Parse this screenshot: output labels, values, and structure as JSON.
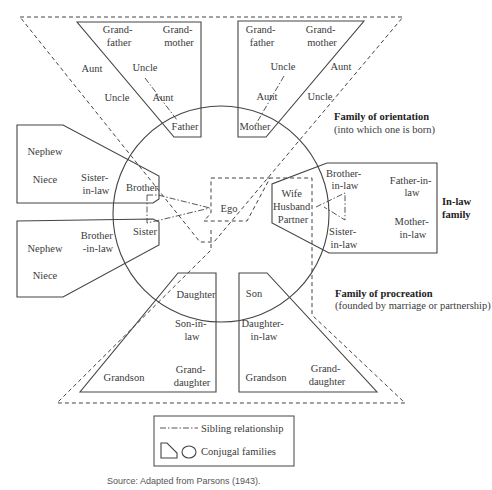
{
  "diagram": {
    "center": {
      "ego": "Ego"
    },
    "orientation_family": {
      "heading": "Family of orientation",
      "subheading": "(into which one is born)",
      "father_box": {
        "grandfather": [
          "Grand-",
          "father"
        ],
        "grandmother": [
          "Grand-",
          "mother"
        ],
        "aunt_outer": "Aunt",
        "uncle_outer": "Uncle",
        "uncle_inner": "Uncle",
        "aunt_inner": "Aunt",
        "parent": "Father"
      },
      "mother_box": {
        "grandfather": [
          "Grand-",
          "father"
        ],
        "grandmother": [
          "Grand-",
          "mother"
        ],
        "uncle_inner": "Uncle",
        "aunt_inner": "Aunt",
        "aunt_outer": "Aunt",
        "uncle_outer": "Uncle",
        "parent": "Mother"
      }
    },
    "sibling_boxes": {
      "brother_box": {
        "nephew": "Nephew",
        "niece": "Niece",
        "spouse": [
          "Sister-",
          "in-law"
        ],
        "sibling": "Brother"
      },
      "sister_box": {
        "nephew": "Nephew",
        "niece": "Niece",
        "spouse": [
          "Brother",
          "-in-law"
        ],
        "sibling": "Sister"
      }
    },
    "inlaw_family": {
      "heading": [
        "In-law",
        "family"
      ],
      "spouse": [
        "Wife",
        "Husband",
        "Partner"
      ],
      "brother_in_law": [
        "Brother-",
        "in-law"
      ],
      "sister_in_law": [
        "Sister-",
        "in-law"
      ],
      "father_in_law": [
        "Father-in-",
        "law"
      ],
      "mother_in_law": [
        "Mother-",
        "in-law"
      ]
    },
    "procreation_family": {
      "heading": "Family of procreation",
      "subheading": "(founded by marriage or partnership)",
      "daughter_box": {
        "child": "Daughter",
        "child_spouse": [
          "Son-in-",
          "law"
        ],
        "grandson": "Grandson",
        "granddaughter": [
          "Grand-",
          "daughter"
        ]
      },
      "son_box": {
        "child": "Son",
        "child_spouse": [
          "Daughter-",
          "in-law"
        ],
        "grandson": "Grandson",
        "granddaughter": [
          "Grand-",
          "daughter"
        ]
      }
    },
    "legend": {
      "sibling_relationship": "Sibling relationship",
      "conjugal_families": "Conjugal families"
    },
    "source": "Source: Adapted from Parsons (1943)."
  }
}
